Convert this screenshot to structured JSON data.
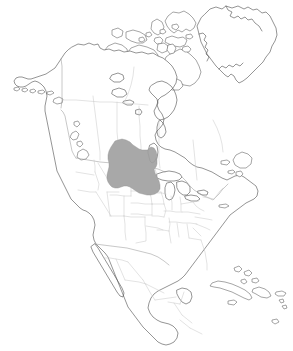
{
  "map": {
    "title": "North America Distribution Map",
    "projection": "Lambert Conformal Conic",
    "background_color": "#ffffff",
    "width": 293,
    "height": 351,
    "has_border_frame": false,
    "has_labels": false,
    "has_legend": false,
    "has_scale_bar": false,
    "has_graticule": false
  },
  "style": {
    "coastline_color": "#4d4d4d",
    "coastline_width": 0.6,
    "subdivision_color": "#c6c6c6",
    "subdivision_width": 0.5,
    "national_border_color": "#9a9a9a",
    "national_border_width": 0.55,
    "range_fill_color": "#a8a8a8",
    "range_stroke_color": "#8f8f8f",
    "land_fill_color": "#ffffff"
  },
  "layers": [
    {
      "name": "continent-outline",
      "label": "North America coastline",
      "stroke": "#4d4d4d",
      "visible": true
    },
    {
      "name": "subdivisions",
      "label": "State and province boundaries",
      "stroke": "#c6c6c6",
      "visible": true
    },
    {
      "name": "distribution-range",
      "label": "Shaded distribution range",
      "fill": "#a8a8a8",
      "visible": true
    }
  ],
  "regions": {
    "landmasses": [
      "Alaska",
      "Canada",
      "Greenland",
      "Contiguous United States",
      "Mexico",
      "Central America",
      "Caribbean Islands",
      "Canadian Arctic Archipelago"
    ],
    "water_bodies": [
      "Hudson Bay",
      "James Bay",
      "Great Lakes",
      "Gulf of Mexico",
      "Gulf of California",
      "Lake Winnipeg",
      "Great Slave Lake",
      "Great Bear Lake",
      "Baffin Bay"
    ],
    "islands": [
      "Baffin Island",
      "Victoria Island",
      "Ellesmere Island",
      "Banks Island",
      "Newfoundland",
      "Cuba",
      "Hispaniola",
      "Puerto Rico",
      "Jamaica",
      "Vancouver Island",
      "Aleutian Islands"
    ]
  },
  "distribution_range": {
    "label": "Shaded range area",
    "fill_color": "#a8a8a8",
    "description": "Northern Great Plains region spanning the United States and Canada",
    "covered_areas": [
      "Montana",
      "Wyoming",
      "North Dakota",
      "South Dakota",
      "Southern Alberta",
      "Southern Saskatchewan",
      "Southwestern Manitoba",
      "Northeastern Colorado",
      "Northwestern Nebraska"
    ],
    "approx_extent": {
      "north_latitude": 53,
      "south_latitude": 41,
      "west_longitude": -114,
      "east_longitude": -96
    }
  }
}
